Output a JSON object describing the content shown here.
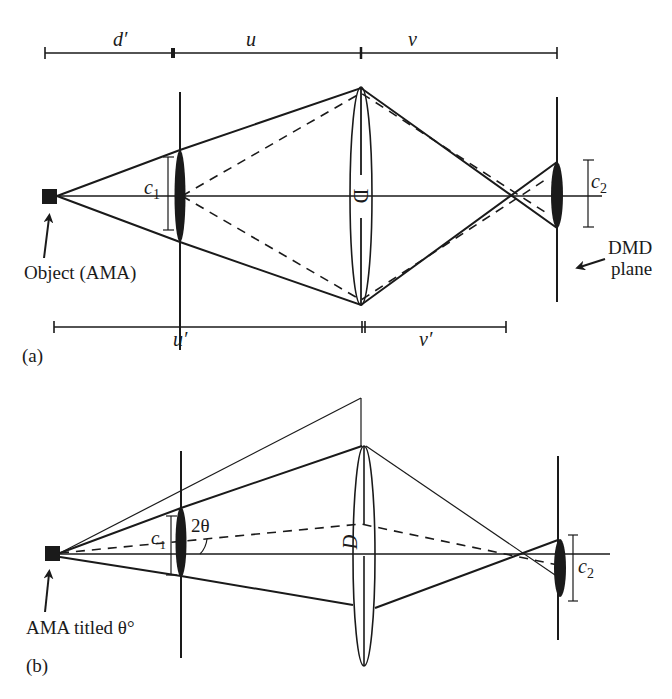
{
  "figure": {
    "panel_a": {
      "label": "(a)",
      "top_dimensions": {
        "d_prime": "d′",
        "u": "u",
        "v": "v"
      },
      "bottom_dimensions": {
        "u_prime": "u′",
        "v_prime": "v′"
      },
      "object_label": "Object (AMA)",
      "aperture_label_main": "c",
      "aperture_label_sub": "1",
      "lens_label": "D",
      "image_aperture_main": "c",
      "image_aperture_sub": "2",
      "dmd_label_line1": "DMD",
      "dmd_label_line2": "plane"
    },
    "panel_b": {
      "label": "(b)",
      "object_label": "AMA titled θ°",
      "aperture_label_main": "c",
      "aperture_label_sub": "1",
      "angle_label": "2θ",
      "lens_label": "D",
      "image_aperture_main": "c",
      "image_aperture_sub": "2"
    }
  }
}
